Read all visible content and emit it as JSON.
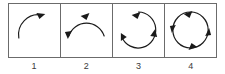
{
  "figure": {
    "type": "diagram",
    "background_color": "#ffffff",
    "border_color": "#6b6b6b",
    "stroke_color": "#1a1a1a",
    "label_color": "#3a3a3a"
  },
  "panels": [
    {
      "label": "1",
      "name": "panel-quarter-arc",
      "arc_degrees": 90,
      "arrowhead_count": 1,
      "arrowheads": [
        "top-right"
      ],
      "direction": "clockwise"
    },
    {
      "label": "2",
      "name": "panel-half-arc",
      "arc_degrees": 180,
      "arrowhead_count": 2,
      "arrowheads": [
        "top",
        "left"
      ],
      "direction": "counterclockwise"
    },
    {
      "label": "3",
      "name": "panel-three-quarter-arc",
      "arc_degrees": 300,
      "arrowhead_count": 3,
      "arrowheads": [
        "top",
        "right",
        "left"
      ],
      "direction": "counterclockwise"
    },
    {
      "label": "4",
      "name": "panel-full-circle",
      "arc_degrees": 360,
      "arrowhead_count": 4,
      "arrowheads": [
        "top",
        "right",
        "bottom",
        "left"
      ],
      "direction": "counterclockwise"
    }
  ]
}
